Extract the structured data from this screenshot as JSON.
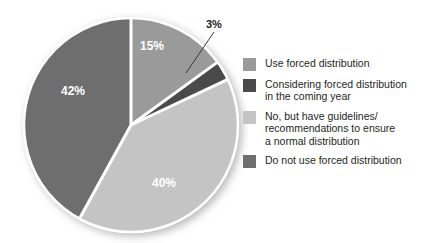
{
  "chart_data": {
    "type": "pie",
    "title": "",
    "subtitle": "",
    "xlabel": "",
    "ylabel": "",
    "legend_position": "right",
    "grid": false,
    "unit": "%",
    "categories": [
      "Use forced distribution",
      "Considering forced distribution in the coming year",
      "No, but have guidelines/recommendations to ensure a normal distribution",
      "Do not use forced distribution"
    ],
    "values": [
      15,
      3,
      40,
      42
    ],
    "slice_labels": [
      "15%",
      "3%",
      "40%",
      "42%"
    ],
    "colors": [
      "#9a9a9a",
      "#4a4a4a",
      "#c4c4c4",
      "#6e6e6e"
    ],
    "start_angle_deg": 0,
    "direction": "clockwise",
    "slices": [
      {
        "label": "15%",
        "value": 15,
        "color": "#9a9a9a",
        "label_color": "#ffffff",
        "label_inside": true
      },
      {
        "label": "3%",
        "value": 3,
        "color": "#4a4a4a",
        "label_color": "#1d1d1d",
        "label_inside": false
      },
      {
        "label": "40%",
        "value": 40,
        "color": "#c4c4c4",
        "label_color": "#ffffff",
        "label_inside": true
      },
      {
        "label": "42%",
        "value": 42,
        "color": "#6e6e6e",
        "label_color": "#ffffff",
        "label_inside": true
      }
    ]
  },
  "callout": {
    "label": "3%"
  },
  "slice_labels": {
    "pct_15": "15%",
    "pct_3": "3%",
    "pct_40": "40%",
    "pct_42": "42%"
  },
  "legend": {
    "items": [
      {
        "label": "Use forced distribution",
        "color": "#9a9a9a"
      },
      {
        "label": "Considering forced distribution\nin the coming year",
        "color": "#4a4a4a"
      },
      {
        "label": "No, but have guidelines/\nrecommendations to ensure\na normal distribution",
        "color": "#c4c4c4"
      },
      {
        "label": "Do not use forced distribution",
        "color": "#6e6e6e"
      }
    ]
  },
  "style": {
    "separator_color": "#ffffff",
    "background": "#ffffff",
    "text_color": "#231f20"
  }
}
